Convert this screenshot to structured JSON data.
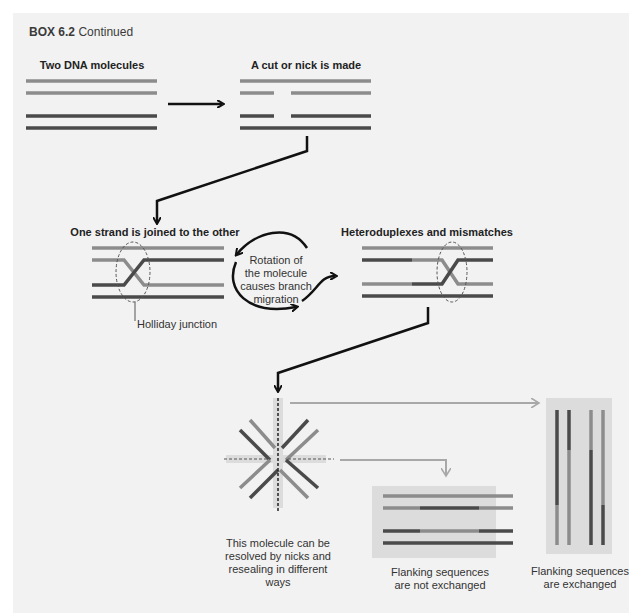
{
  "box": {
    "label": "BOX 6.2",
    "subtitle": "Continued"
  },
  "panels": {
    "two_molecules": {
      "title": "Two DNA molecules"
    },
    "nick": {
      "title": "A cut or nick is made"
    },
    "joined": {
      "title": "One strand is joined to the other",
      "callout": "Holliday junction"
    },
    "rotation": {
      "text": [
        "Rotation of",
        "the molecule",
        "causes branch",
        "migration"
      ]
    },
    "heteroduplex": {
      "title": "Heteroduplexes and mismatches"
    },
    "resolution": {
      "caption": [
        "This molecule can be",
        "resolved by nicks and",
        "resealing in different",
        "ways"
      ]
    },
    "not_exchanged": {
      "caption": [
        "Flanking sequences",
        "are not exchanged"
      ]
    },
    "exchanged": {
      "caption": [
        "Flanking sequences",
        "are exchanged"
      ]
    }
  },
  "colors": {
    "background": "#f2f2f2",
    "light_strand": "#8c8c8c",
    "dark_strand": "#4a4a4a",
    "arrow": "#111111",
    "gray_arrow": "#a8a8a8",
    "panel_shade": "#dcdcdc"
  }
}
